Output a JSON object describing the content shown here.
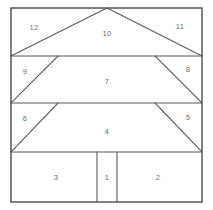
{
  "figure": {
    "canvas": {
      "width": 213,
      "height": 210
    },
    "frame": {
      "left": 11,
      "top": 8,
      "right": 202,
      "bottom": 202
    },
    "colors": {
      "background": "#ffffff",
      "line": "#5a5a5a",
      "frame": "#4a4a4a",
      "label": "#6b6b6b"
    },
    "band_dividers_y": [
      56,
      103,
      152
    ],
    "apex_x": 107,
    "regions": [
      {
        "id": "1",
        "label": "1",
        "x": 107,
        "y": 177,
        "shape": "rectangle"
      },
      {
        "id": "2",
        "label": "2",
        "x": 158,
        "y": 177,
        "shape": "rectangle"
      },
      {
        "id": "3",
        "label": "3",
        "x": 56,
        "y": 177,
        "shape": "rectangle"
      },
      {
        "id": "4",
        "label": "4",
        "x": 107,
        "y": 131,
        "shape": "trapezoid"
      },
      {
        "id": "5",
        "label": "5",
        "x": 188,
        "y": 117,
        "shape": "triangle"
      },
      {
        "id": "6",
        "label": "6",
        "x": 25,
        "y": 118,
        "shape": "triangle"
      },
      {
        "id": "7",
        "label": "7",
        "x": 107,
        "y": 81,
        "shape": "trapezoid"
      },
      {
        "id": "8",
        "label": "8",
        "x": 188,
        "y": 69,
        "shape": "triangle"
      },
      {
        "id": "9",
        "label": "9",
        "x": 25,
        "y": 71,
        "shape": "triangle"
      },
      {
        "id": "10",
        "label": "10",
        "x": 107,
        "y": 33,
        "shape": "triangle"
      },
      {
        "id": "11",
        "label": "11",
        "x": 180,
        "y": 26,
        "shape": "triangle"
      },
      {
        "id": "12",
        "label": "12",
        "x": 34,
        "y": 27,
        "shape": "triangle"
      }
    ],
    "segments": [
      {
        "name": "outer-frame-rect",
        "type": "rect",
        "x": 11,
        "y": 8,
        "width": 191,
        "height": 194
      },
      {
        "name": "band1-divider",
        "type": "line",
        "x1": 11,
        "y1": 56,
        "x2": 202,
        "y2": 56
      },
      {
        "name": "band2-divider",
        "type": "line",
        "x1": 11,
        "y1": 103,
        "x2": 202,
        "y2": 103
      },
      {
        "name": "band3-divider",
        "type": "line",
        "x1": 11,
        "y1": 152,
        "x2": 202,
        "y2": 152
      },
      {
        "name": "roof-left-slope",
        "type": "line",
        "x1": 107,
        "y1": 8,
        "x2": 11,
        "y2": 56
      },
      {
        "name": "roof-right-slope",
        "type": "line",
        "x1": 107,
        "y1": 8,
        "x2": 202,
        "y2": 56
      },
      {
        "name": "tier2-left-slope",
        "type": "line",
        "x1": 58,
        "y1": 56,
        "x2": 11,
        "y2": 103
      },
      {
        "name": "tier2-right-slope",
        "type": "line",
        "x1": 155,
        "y1": 56,
        "x2": 202,
        "y2": 103
      },
      {
        "name": "tier3-left-slope",
        "type": "line",
        "x1": 58,
        "y1": 103,
        "x2": 11,
        "y2": 152
      },
      {
        "name": "tier3-right-slope",
        "type": "line",
        "x1": 155,
        "y1": 103,
        "x2": 202,
        "y2": 152
      },
      {
        "name": "trunk-left-divider",
        "type": "line",
        "x1": 97,
        "y1": 152,
        "x2": 97,
        "y2": 202
      },
      {
        "name": "trunk-right-divider",
        "type": "line",
        "x1": 117,
        "y1": 152,
        "x2": 117,
        "y2": 202
      }
    ]
  }
}
